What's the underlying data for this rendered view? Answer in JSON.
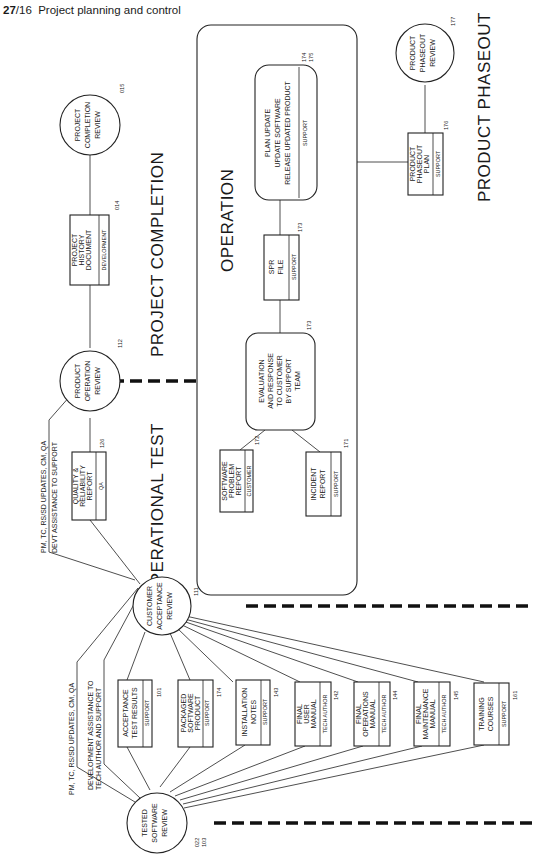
{
  "page_header": {
    "chapter": "27",
    "page": "/16",
    "title": "Project planning and control"
  },
  "phases": [
    {
      "id": "operational-test",
      "label": "OPERATIONAL TEST"
    },
    {
      "id": "project-completion",
      "label": "PROJECT COMPLETION"
    },
    {
      "id": "operation",
      "label": "OPERATION"
    },
    {
      "id": "product-phaseout",
      "label": "PRODUCT PHASEOUT"
    }
  ],
  "reviews": {
    "tested_software": {
      "lines": [
        "TESTED",
        "SOFTWARE",
        "REVIEW"
      ],
      "codes": [
        "022",
        "103"
      ]
    },
    "customer_acceptance": {
      "lines": [
        "CUSTOMER",
        "ACCEPTANCE",
        "REVIEW"
      ],
      "code": "111"
    },
    "product_operation": {
      "lines": [
        "PRODUCT",
        "OPERATION",
        "REVIEW"
      ],
      "code": "112"
    },
    "project_completion": {
      "lines": [
        "PROJECT",
        "COMPLETION",
        "REVIEW"
      ],
      "code": "015"
    },
    "product_phaseout": {
      "lines": [
        "PRODUCT",
        "PHASEOUT",
        "REVIEW"
      ],
      "code": "177"
    }
  },
  "notes": {
    "ts_to_ca_1": "PM, TC, RS/SD UPDATES, CM, QA",
    "ts_to_ca_2a": "DEVELOPMENT ASSISTANCE TO",
    "ts_to_ca_2b": "TECH AUTHOR AND SUPPORT",
    "ca_to_po_1": "PM, TC, RS/SD UPDATES, CM, QA",
    "ca_to_po_2": "DEVT ASSISTANCE TO SUPPORT"
  },
  "deliverables": [
    {
      "lines": [
        "ACCEPTANCE",
        "TEST RESULTS"
      ],
      "owner": "SUPPORT",
      "code": "101"
    },
    {
      "lines": [
        "PACKAGED",
        "SOFTWARE",
        "PRODUCT"
      ],
      "owner": "SUPPORT",
      "code": "174"
    },
    {
      "lines": [
        "INSTALLATION",
        "NOTES"
      ],
      "owner": "SUPPORT",
      "code": "143"
    },
    {
      "lines": [
        "FINAL",
        "USER",
        "MANUAL"
      ],
      "owner": "TECH AUTHOR",
      "code": "142"
    },
    {
      "lines": [
        "FINAL",
        "OPERATIONS",
        "MANUAL"
      ],
      "owner": "TECH AUTHOR",
      "code": "144"
    },
    {
      "lines": [
        "FINAL",
        "MAINTENANCE",
        "MANUAL"
      ],
      "owner": "TECH AUTHOR",
      "code": "145"
    },
    {
      "lines": [
        "TRAINING",
        "COURSES"
      ],
      "owner": "SUPPORT",
      "code": "161"
    }
  ],
  "quality_report": {
    "lines": [
      "QUALITY &",
      "RELIABILITY",
      "REPORT"
    ],
    "owner": "QA",
    "code": "126"
  },
  "history_doc": {
    "lines": [
      "PROJECT",
      "HISTORY",
      "DOCUMENT"
    ],
    "owner": "DEVELOPMENT",
    "code": "014"
  },
  "operation": {
    "software_problem_report": {
      "lines": [
        "SOFTWARE",
        "PROBLEM",
        "REPORT"
      ],
      "owner": "CUSTOMER",
      "code": "172"
    },
    "incident_report": {
      "lines": [
        "INCIDENT",
        "REPORT"
      ],
      "owner": "SUPPORT",
      "code": "171"
    },
    "evaluation": {
      "lines": [
        "EVALUATION",
        "AND RESPONSE",
        "TO CUSTOMER",
        "BY SUPPORT",
        "TEAM"
      ],
      "code": "173"
    },
    "spr_file": {
      "lines": [
        "SPR",
        "FILE"
      ],
      "owner": "SUPPORT",
      "code": "173"
    },
    "plan_update": {
      "lines": [
        "PLAN UPDATE",
        "UPDATE SOFTWARE",
        "RELEASE UPDATED PRODUCT"
      ],
      "owner": "SUPPORT",
      "codes": [
        "174",
        "175"
      ]
    }
  },
  "phaseout_plan": {
    "lines": [
      "PRODUCT",
      "PHASEOUT",
      "PLAN"
    ],
    "owner": "SUPPORT",
    "code": "176"
  }
}
